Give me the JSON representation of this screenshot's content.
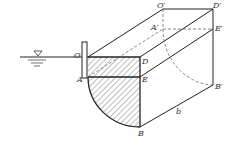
{
  "diagram": {
    "labels": {
      "O": "O",
      "A": "A",
      "D": "D",
      "E": "E",
      "B": "B",
      "O_prime": "O′",
      "A_prime": "A′",
      "D_prime": "D′",
      "E_prime": "E′",
      "B_prime": "B′",
      "b": "b"
    },
    "colors": {
      "line": "#222222",
      "dashed": "#555555",
      "hatch": "#444444",
      "background": "#ffffff"
    },
    "symbols": {
      "water_surface": "water-level-triangle-icon"
    }
  }
}
